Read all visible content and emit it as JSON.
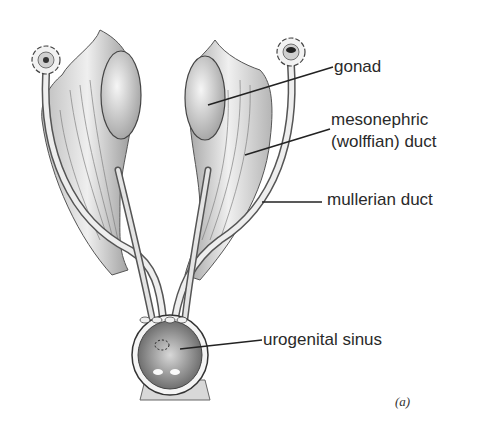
{
  "figure": {
    "caption_tag": "(a)",
    "labels": {
      "gonad": "gonad",
      "mesonephric_line1": "mesonephric",
      "mesonephric_line2": "(wolffian) duct",
      "mullerian": "mullerian duct",
      "urogenital": "urogenital sinus"
    },
    "colors": {
      "ink": "#2a2a2a",
      "tissue": "#e8e8e8",
      "shade": "#8a8a8a",
      "background": "#ffffff"
    }
  }
}
